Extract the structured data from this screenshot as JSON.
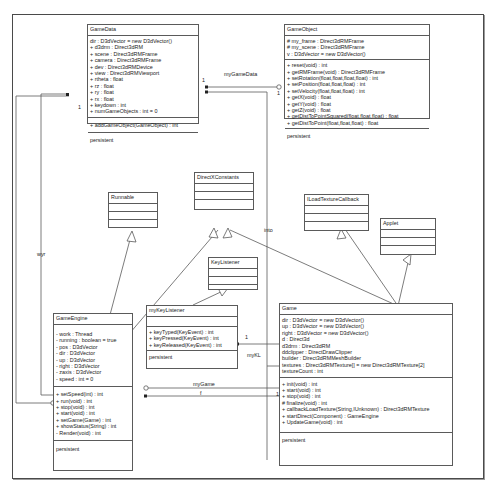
{
  "classes": {
    "gamedata": {
      "name": "GameData",
      "attributes": [
        "dir : D3dVector = new D3dVector()",
        "+ d3drm : Direct3dRM",
        "+ scene : Direct3dRMFrame",
        "+ camera : Direct3dRMFrame",
        "+ dev : Direct3dRMDevice",
        "+ view : Direct3dRMViewport",
        "+ rtheta : float",
        "+ rz : float",
        "+ ry : float",
        "+ rx : float",
        "+ keydown : int",
        "+ numGameObjects : int = 0"
      ],
      "operations": [
        "+ addGameObject(GameObject) : int"
      ],
      "footer": "persistent"
    },
    "gameobject": {
      "name": "GameObject",
      "attributes": [
        "# my_frame : Direct3dRMFrame",
        "# my_scene : Direct3dRMFrame",
        "v : D3dVector = new D3dVector()"
      ],
      "operations": [
        "+ reset(void) : int",
        "+ getRMFrame(void) : Direct3dRMFrame",
        "+ setRotation(float,float,float,float) : int",
        "+ setPosition(float,float,float) : int",
        "+ setVelocity(float,float,float) : int",
        "+ getX(void) : float",
        "+ getY(void) : float",
        "+ getZ(void) : float",
        "+ getDistToPointSquared(float,float,float) : float",
        "+ getDistToPoint(float,float,float) : float"
      ],
      "footer": "persistent"
    },
    "runnable": {
      "name": "Runnable"
    },
    "directxconstants": {
      "name": "DirectXConstants"
    },
    "iloadtexturecallback": {
      "name": "ILoadTextureCallback"
    },
    "applet": {
      "name": "Applet"
    },
    "keylistener": {
      "name": "KeyListener"
    },
    "mykeylistener": {
      "name": "myKeyListener",
      "attributes": [],
      "operations": [
        "+ keyTyped(KeyEvent) : int",
        "+ keyPressed(KeyEvent) : int",
        "+ keyReleased(KeyEvent) : int"
      ],
      "footer": "persistent"
    },
    "gameengine": {
      "name": "GameEngine",
      "attributes": [
        "- work : Thread",
        "- running : boolean = true",
        "- pos : D3dVector",
        "- dir : D3dVector",
        "- up : D3dVector",
        "- right : D3dVector",
        "- zaxis : D3dVector",
        "- speed : int = 0"
      ],
      "operations": [
        "+ setSpeed(int) : int",
        "+ run(void) : int",
        "+ stop(void) : int",
        "+ start(void) : int",
        "+ setGame(Game) : int",
        "+ showStatus(String) : int",
        "- Render(void) : int"
      ],
      "footer": "persistent"
    },
    "game": {
      "name": "Game",
      "attributes": [
        "dir : D3dVector = new D3dVector()",
        "up : D3dVector = new D3dVector()",
        "right : D3dVector = new D3dVector()",
        "d : Direct3d",
        "d3drm : Direct3dRM",
        "ddclipper : DirectDrawClipper",
        "builder : Direct3dRMMeshBuilder",
        "textures : Direct3dRMTexture[] = new Direct3dRMTexture[2]",
        "textureCount : int"
      ],
      "operations": [
        "+ init(void) : int",
        "+ start(void) : int",
        "+ stop(void) : int",
        "# finalize(void) : int",
        "+ callbackLoadTexture(String,IUnknown) : Direct3dRMTexture",
        "+ startDirect(Component) : GameEngine",
        "+ UpdateGame(void) : int"
      ],
      "footer": "persistent"
    }
  },
  "associations": {
    "mygamedata": {
      "label": "myGameData",
      "mult_source": "1",
      "mult_target": "1"
    },
    "wyr": {
      "label": "wyr",
      "mult": "1"
    },
    "into": {
      "label": "into"
    },
    "mykl": {
      "label": "myKL",
      "mult": "1"
    },
    "mygame": {
      "label": "myGame",
      "mult": "1"
    },
    "f": {
      "label": "f",
      "mult": "1"
    }
  },
  "colors": {
    "line": "#5a5a5a",
    "frame": "#4a4a4a",
    "background": "#ffffff"
  }
}
